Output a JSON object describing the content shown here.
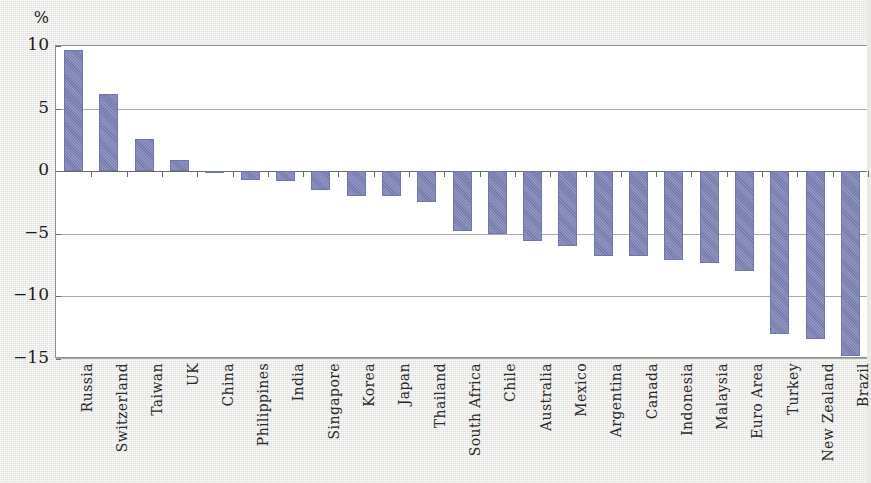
{
  "chart_data": {
    "type": "bar",
    "title": "",
    "subtitle": "",
    "xlabel": "",
    "ylabel": "%",
    "unit_label": "%",
    "ylim": [
      -15,
      10
    ],
    "yticks": [
      10,
      5,
      0,
      -5,
      -10,
      -15
    ],
    "ytick_labels": [
      "10",
      "5",
      "0",
      "−5",
      "−10",
      "−15"
    ],
    "grid": true,
    "grid_axis": "y",
    "legend": null,
    "legend_position": "none",
    "bar_color": "#7b82b5",
    "background_color": "#e9e9e5",
    "plot_background_color": "#ffffff",
    "axis_color": "#6a6a6a",
    "categories": [
      "Russia",
      "Switzerland",
      "Taiwan",
      "UK",
      "China",
      "Philippines",
      "India",
      "Singapore",
      "Korea",
      "Japan",
      "Thailand",
      "South Africa",
      "Chile",
      "Australia",
      "Mexico",
      "Argentina",
      "Canada",
      "Indonesia",
      "Malaysia",
      "Euro Area",
      "Turkey",
      "New Zealand",
      "Brazil"
    ],
    "values": [
      9.7,
      6.2,
      2.6,
      0.9,
      -0.1,
      -0.7,
      -0.8,
      -1.5,
      -2.0,
      -2.0,
      -2.5,
      -4.8,
      -5.0,
      -5.6,
      -6.0,
      -6.8,
      -6.8,
      -7.1,
      -7.3,
      -8.0,
      -13.0,
      -13.4,
      -14.8
    ]
  }
}
